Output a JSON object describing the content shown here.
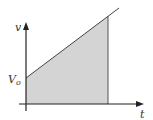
{
  "diagram": {
    "type": "velocity-time graph",
    "y_axis_label": "v",
    "x_axis_label": "t",
    "intercept_label": "V",
    "intercept_subscript": "o",
    "colors": {
      "line": "#444444",
      "axis": "#222222",
      "fill": "#d4d4d4",
      "text": "#333333"
    },
    "shape": "trapezoid area under straight line from V0 (shaded)"
  }
}
